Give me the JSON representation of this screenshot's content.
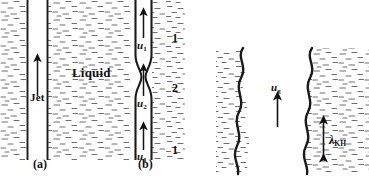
{
  "figure": {
    "type": "scientific-diagram",
    "background_color": "#ffffff",
    "ink_color": "#1a1a1a"
  },
  "panel_a": {
    "caption": "(a)",
    "jet_label": "Jet",
    "liquid_label": "Liquid",
    "arrow": "up-arrow"
  },
  "panel_b": {
    "caption": "(b)",
    "velocity_top": "u",
    "velocity_top_sub": "1",
    "velocity_mid": "u",
    "velocity_mid_sub": "2",
    "velocity_bottom": "u",
    "velocity_bottom_sub": "1",
    "station_top": "1",
    "station_mid": "2",
    "station_bottom": "1"
  },
  "panel_c": {
    "gas_velocity": "u",
    "gas_velocity_sub": "g",
    "wavelength_symbol": "λ",
    "wavelength_sub": "KH"
  }
}
